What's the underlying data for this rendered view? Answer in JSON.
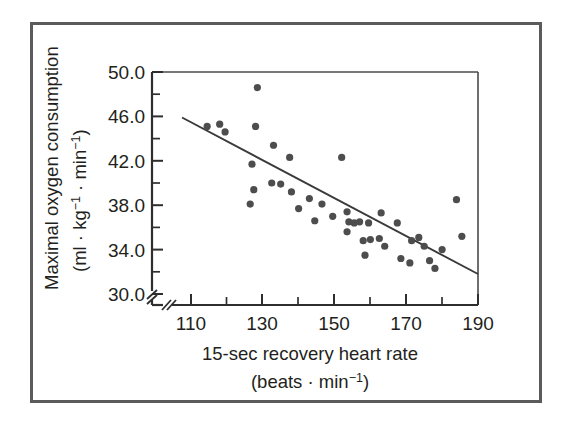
{
  "figure": {
    "border_color": "#5b5b5b",
    "ink_color": "#231f20",
    "point_color": "#4d4d4d",
    "background": "#ffffff"
  },
  "axes": {
    "y_title_line1": "Maximal oxygen consumption",
    "y_title_line2_pre": "(ml",
    "y_title_line2_dot1": "·",
    "y_title_line2_kg": "kg",
    "y_title_line2_kg_sup": "−1",
    "y_title_line2_dot2": "·",
    "y_title_line2_min": "min",
    "y_title_line2_min_sup": "−1",
    "y_title_line2_close": ")",
    "x_title_line1": "15-sec recovery heart rate",
    "x_title_line2_pre": "(beats",
    "x_title_line2_dot": "·",
    "x_title_line2_min": "min",
    "x_title_line2_sup": "−1",
    "x_title_line2_close": ")",
    "y_tick_labels": [
      "50.0",
      "46.0",
      "42.0",
      "38.0",
      "34.0",
      "30.0"
    ],
    "y_tick_values": [
      50.0,
      46.0,
      42.0,
      38.0,
      34.0,
      30.0
    ],
    "y_minor_values": [
      48.0,
      44.0,
      40.0,
      36.0,
      32.0
    ],
    "x_tick_labels": [
      "110",
      "130",
      "150",
      "170",
      "190"
    ],
    "x_tick_values": [
      110,
      130,
      150,
      170,
      190
    ],
    "x_minor_values": [
      120,
      140,
      160,
      180
    ],
    "y_axis_break": true,
    "x_axis_break": true,
    "grid": false,
    "legend": "none"
  },
  "chart_data": {
    "type": "scatter",
    "title": "",
    "xlabel": "15-sec recovery heart rate (beats · min−1)",
    "ylabel": "Maximal oxygen consumption (ml · kg−1 · min−1)",
    "xlim": [
      106,
      190
    ],
    "ylim": [
      29.2,
      50.0
    ],
    "xticks": [
      110,
      130,
      150,
      170,
      190
    ],
    "yticks": [
      30.0,
      34.0,
      38.0,
      42.0,
      46.0,
      50.0
    ],
    "grid": false,
    "series": [
      {
        "name": "Subjects",
        "marker": "filled-circle",
        "color": "#4d4d4d",
        "points": [
          {
            "x": 114.5,
            "y": 45.1
          },
          {
            "x": 118.0,
            "y": 45.3
          },
          {
            "x": 119.5,
            "y": 44.6
          },
          {
            "x": 128.5,
            "y": 48.6
          },
          {
            "x": 128.0,
            "y": 45.1
          },
          {
            "x": 127.0,
            "y": 41.7
          },
          {
            "x": 126.5,
            "y": 38.1
          },
          {
            "x": 127.5,
            "y": 39.4
          },
          {
            "x": 133.0,
            "y": 43.4
          },
          {
            "x": 132.5,
            "y": 40.0
          },
          {
            "x": 135.0,
            "y": 39.9
          },
          {
            "x": 137.5,
            "y": 42.3
          },
          {
            "x": 138.0,
            "y": 39.2
          },
          {
            "x": 140.0,
            "y": 37.7
          },
          {
            "x": 143.0,
            "y": 38.6
          },
          {
            "x": 146.5,
            "y": 38.1
          },
          {
            "x": 144.5,
            "y": 36.6
          },
          {
            "x": 149.5,
            "y": 37.0
          },
          {
            "x": 152.0,
            "y": 42.3
          },
          {
            "x": 153.5,
            "y": 37.4
          },
          {
            "x": 154.0,
            "y": 36.5
          },
          {
            "x": 155.5,
            "y": 36.4
          },
          {
            "x": 153.5,
            "y": 35.6
          },
          {
            "x": 157.0,
            "y": 36.5
          },
          {
            "x": 158.0,
            "y": 34.8
          },
          {
            "x": 159.5,
            "y": 36.4
          },
          {
            "x": 160.0,
            "y": 34.9
          },
          {
            "x": 158.5,
            "y": 33.5
          },
          {
            "x": 162.5,
            "y": 35.0
          },
          {
            "x": 163.0,
            "y": 37.3
          },
          {
            "x": 164.0,
            "y": 34.3
          },
          {
            "x": 167.5,
            "y": 36.4
          },
          {
            "x": 168.5,
            "y": 33.2
          },
          {
            "x": 171.5,
            "y": 34.8
          },
          {
            "x": 171.0,
            "y": 32.8
          },
          {
            "x": 173.5,
            "y": 35.1
          },
          {
            "x": 175.0,
            "y": 34.3
          },
          {
            "x": 176.5,
            "y": 33.0
          },
          {
            "x": 178.0,
            "y": 32.3
          },
          {
            "x": 180.0,
            "y": 34.0
          },
          {
            "x": 184.0,
            "y": 38.5
          },
          {
            "x": 185.5,
            "y": 35.2
          }
        ]
      }
    ],
    "trendline": {
      "name": "regression-line",
      "x_start": 107.5,
      "y_start": 45.9,
      "x_end": 190.0,
      "y_end": 31.8,
      "color": "#3a3a3a"
    }
  }
}
